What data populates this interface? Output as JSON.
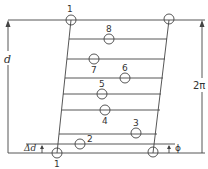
{
  "diagram": {
    "title": "",
    "colors": {
      "line": "#444444",
      "background": "#ffffff"
    },
    "dimension_labels": {
      "left": "d",
      "right": "2π",
      "delta_d": "Δd",
      "phi": "ϕ"
    },
    "corner_labels": {
      "top_left": "1",
      "bottom_left": "1"
    },
    "rungs": [
      {
        "label": "8",
        "y": 39
      },
      {
        "label": "7",
        "y": 59
      },
      {
        "label": "6",
        "y": 78
      },
      {
        "label": "5",
        "y": 94
      },
      {
        "label": "4",
        "y": 110
      },
      {
        "label": "3",
        "y": 134
      },
      {
        "label": "2",
        "y": 144
      }
    ]
  }
}
